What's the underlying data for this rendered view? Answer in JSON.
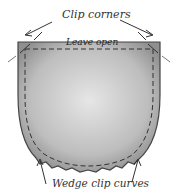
{
  "diagram": {
    "labels": {
      "clip_corners": "Clip corners",
      "leave_open": "Leave open",
      "wedge_clip_curves": "Wedge clip curves"
    },
    "colors": {
      "fabric_fill": "#b9b9b9",
      "outline": "#444444",
      "text": "#333333"
    }
  }
}
